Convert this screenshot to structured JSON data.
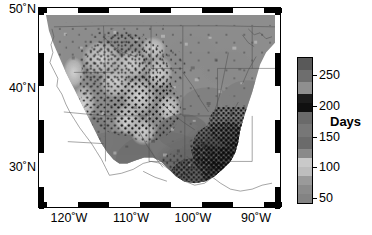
{
  "figure": {
    "type": "map",
    "kind": "choropleth-raster-with-stippling",
    "region": "Western and Central United States",
    "background_color": "#ffffff",
    "frame_color": "#000000"
  },
  "map": {
    "lon_min": -125,
    "lon_max": -86,
    "lat_min": 25,
    "lat_max": 50.5,
    "x_axis": {
      "label": "",
      "ticks": [
        {
          "value": -120,
          "label": "120˚W",
          "x_frac": 0.128
        },
        {
          "value": -110,
          "label": "110˚W",
          "x_frac": 0.385
        },
        {
          "value": -100,
          "label": "100˚W",
          "x_frac": 0.641
        },
        {
          "value": -90,
          "label": "90˚W",
          "x_frac": 0.897
        }
      ]
    },
    "y_axis": {
      "label": "",
      "ticks": [
        {
          "value": 50,
          "label": "50˚N",
          "y_frac": 0.02
        },
        {
          "value": 40,
          "label": "40˚N",
          "y_frac": 0.412
        },
        {
          "value": 30,
          "label": "30˚N",
          "y_frac": 0.804
        }
      ]
    },
    "frame_tick_interval_deg": 5,
    "stipple_description": "black dots marking significant grid cells, densest over the southern Great Plains / Gulf Coast and the Intermountain West"
  },
  "colorbar": {
    "title": "Days",
    "orientation": "vertical",
    "vmin": 40,
    "vmax": 280,
    "ticks": [
      {
        "value": 250,
        "label": "250",
        "y_frac": 0.125
      },
      {
        "value": 200,
        "label": "200",
        "y_frac": 0.333
      },
      {
        "value": 150,
        "label": "150",
        "y_frac": 0.542
      },
      {
        "value": 100,
        "label": "100",
        "y_frac": 0.75
      },
      {
        "value": 50,
        "label": "50",
        "y_frac": 0.958
      }
    ],
    "bands": [
      {
        "from": 280,
        "to": 260,
        "color": "#595959"
      },
      {
        "from": 260,
        "to": 240,
        "color": "#6e6e6e"
      },
      {
        "from": 240,
        "to": 220,
        "color": "#8f8f8f"
      },
      {
        "from": 220,
        "to": 205,
        "color": "#1c1c1c"
      },
      {
        "from": 205,
        "to": 190,
        "color": "#101010"
      },
      {
        "from": 190,
        "to": 170,
        "color": "#6a6a6a"
      },
      {
        "from": 170,
        "to": 150,
        "color": "#777777"
      },
      {
        "from": 150,
        "to": 130,
        "color": "#6b6b6b"
      },
      {
        "from": 130,
        "to": 115,
        "color": "#8a8a8a"
      },
      {
        "from": 115,
        "to": 100,
        "color": "#c9c9c9"
      },
      {
        "from": 100,
        "to": 85,
        "color": "#bdbdbd"
      },
      {
        "from": 85,
        "to": 70,
        "color": "#9a9a9a"
      },
      {
        "from": 70,
        "to": 55,
        "color": "#8b8b8b"
      },
      {
        "from": 55,
        "to": 40,
        "color": "#838383"
      }
    ]
  },
  "chart_data": {
    "type": "heatmap",
    "title": "",
    "xlabel": "",
    "ylabel": "",
    "zlabel": "Days",
    "xlim": [
      -125,
      -86
    ],
    "ylim": [
      25,
      50.5
    ],
    "zlim": [
      40,
      280
    ],
    "xtick_labels": [
      "120˚W",
      "110˚W",
      "100˚W",
      "90˚W"
    ],
    "ytick_labels": [
      "50˚N",
      "40˚N",
      "30˚N"
    ],
    "colorbar_ticks": [
      250,
      200,
      150,
      100,
      50
    ],
    "grid": false,
    "legend_position": "right",
    "regions": [
      {
        "name": "Pacific Northwest coast",
        "approx_value": 170,
        "shade": "#7c7c7c"
      },
      {
        "name": "Northern Rockies",
        "approx_value": 120,
        "shade": "#b2b2b2"
      },
      {
        "name": "Sierra Nevada / high Cascades",
        "approx_value": 95,
        "shade": "#c6c6c6"
      },
      {
        "name": "Great Basin",
        "approx_value": 150,
        "shade": "#8a8a8a"
      },
      {
        "name": "Central California valley",
        "approx_value": 185,
        "shade": "#6f6f6f"
      },
      {
        "name": "Desert Southwest",
        "approx_value": 215,
        "shade": "#5a5a5a"
      },
      {
        "name": "Northern Great Plains",
        "approx_value": 150,
        "shade": "#8d8d8d"
      },
      {
        "name": "Central Great Plains",
        "approx_value": 175,
        "shade": "#7a7a7a"
      },
      {
        "name": "Southern Great Plains / Texas",
        "approx_value": 210,
        "shade": "#606060"
      },
      {
        "name": "Gulf Coast / Lower Mississippi",
        "approx_value": 235,
        "shade": "#545454"
      },
      {
        "name": "Upper Midwest",
        "approx_value": 140,
        "shade": "#959595"
      }
    ]
  }
}
